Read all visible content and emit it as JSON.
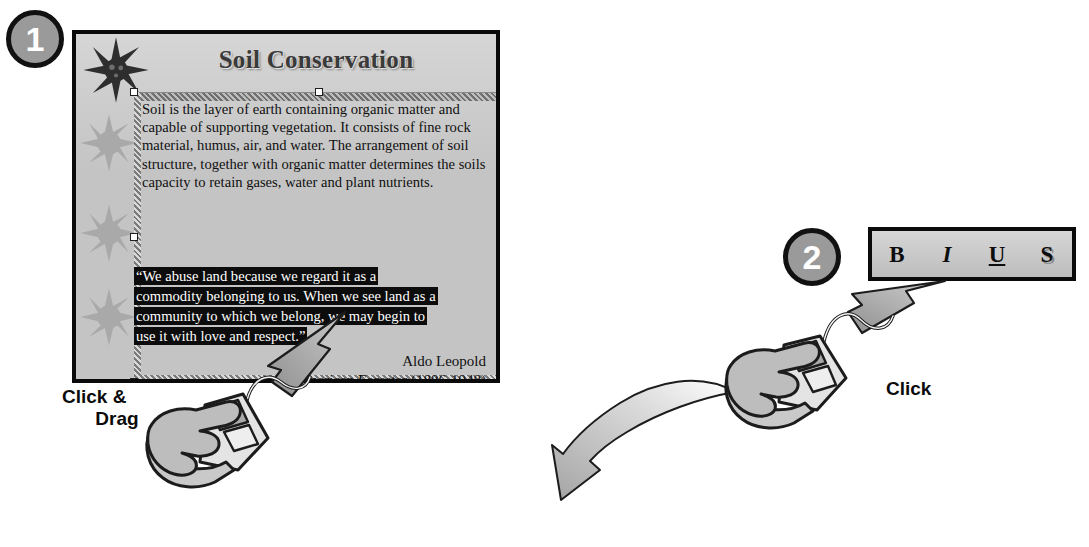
{
  "steps": [
    {
      "number": "1"
    },
    {
      "number": "2"
    }
  ],
  "slide": {
    "title": "Soil Conservation",
    "body_paragraph": "Soil is the layer of earth containing organic matter and capable of supporting vegetation. It consists of fine rock material, humus, air, and water. The arrangement of soil structure, together with organic matter determines the soils capacity to retain gases, water and plant nutrients.",
    "quote_lines": [
      "“We abuse land because we regard it as a",
      "commodity belonging to us. When we see land as a",
      "community to which we belong, we may begin to",
      "use it with love and respect.”"
    ],
    "attribution_name": "Aldo Leopold",
    "attribution_role": "American Forester (1886-1948)",
    "decorations": {
      "dark_star": "sun-star-dark",
      "light_stars": [
        "sun-star-light",
        "sun-star-light",
        "sun-star-light"
      ]
    }
  },
  "toolbar": {
    "buttons": [
      {
        "label": "B",
        "name": "bold"
      },
      {
        "label": "I",
        "name": "italic"
      },
      {
        "label": "U",
        "name": "underline"
      },
      {
        "label": "S",
        "name": "shadow"
      }
    ]
  },
  "captions": {
    "drag_line1": "Click &",
    "drag_line2": "Drag",
    "click": "Click"
  },
  "colors": {
    "slide_background": "#c4c4c4",
    "slide_border": "#0a0a0a",
    "highlight_background": "#0c0c0c",
    "highlight_text": "#ffffff",
    "badge_fill": "#9a9a9a",
    "badge_ring": "#111111",
    "arrow_fill": "#a8a8a8",
    "arrow_outline": "#1a1a1a",
    "toolbar_fill": "#cccccc",
    "title_text": "#3a3a3a"
  }
}
